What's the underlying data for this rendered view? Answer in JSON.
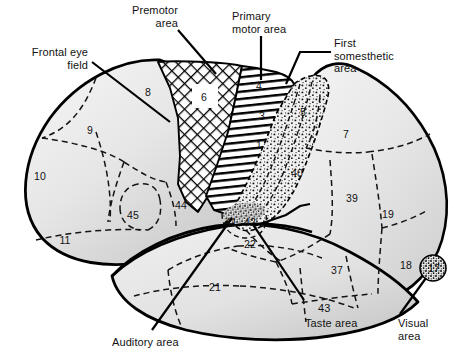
{
  "figure": {
    "view": "lateral"
  },
  "palette": {
    "outline": "#000000",
    "cortex_fill_light": "#ededed",
    "cortex_fill_mid": "#e0e0e0",
    "cortex_fill_dark": "#c9c9c9",
    "dashed_border": "#1a1a1a",
    "text": "#121212",
    "leader_line": "#000000",
    "hatch_crosshatch": "#000000",
    "hatch_horizontal": "#000000",
    "stipple": "#000000"
  },
  "callouts": [
    {
      "id": "premotor",
      "text": "Premotor\narea",
      "x": 108,
      "y": 4,
      "align": "right",
      "width": 70
    },
    {
      "id": "primary-motor",
      "text": "Primary\nmotor area",
      "x": 232,
      "y": 10,
      "align": "left",
      "width": 80
    },
    {
      "id": "first-somesthetic",
      "text": "First\nsomesthetic\narea",
      "x": 334,
      "y": 37,
      "align": "left",
      "width": 80
    },
    {
      "id": "frontal-eye-field",
      "text": "Frontal eye\nfield",
      "x": 8,
      "y": 46,
      "align": "right",
      "width": 80
    },
    {
      "id": "auditory",
      "text": "Auditory area",
      "x": 112,
      "y": 336,
      "align": "left",
      "width": 90
    },
    {
      "id": "taste-number",
      "text": "43",
      "x": 318,
      "y": 302,
      "align": "left",
      "width": 24
    },
    {
      "id": "taste",
      "text": "Taste area",
      "x": 305,
      "y": 317,
      "align": "left",
      "width": 70
    },
    {
      "id": "visual",
      "text": "Visual\narea",
      "x": 398,
      "y": 317,
      "align": "left",
      "width": 48
    }
  ],
  "brodmann_areas": [
    {
      "number": "8",
      "x": 148,
      "y": 92,
      "region": "frontal"
    },
    {
      "number": "6",
      "x": 203,
      "y": 96,
      "region": "premotor",
      "boxed": true
    },
    {
      "number": "4",
      "x": 259,
      "y": 86,
      "region": "primary-motor"
    },
    {
      "number": "9",
      "x": 90,
      "y": 130,
      "region": "frontal"
    },
    {
      "number": "3",
      "x": 262,
      "y": 116,
      "region": "somesthetic"
    },
    {
      "number": "1",
      "x": 259,
      "y": 145,
      "region": "somesthetic"
    },
    {
      "number": "5",
      "x": 303,
      "y": 112,
      "region": "parietal"
    },
    {
      "number": "7",
      "x": 346,
      "y": 134,
      "region": "parietal"
    },
    {
      "number": "10",
      "x": 40,
      "y": 176,
      "region": "frontal-pole"
    },
    {
      "number": "40",
      "x": 297,
      "y": 173,
      "region": "parietal"
    },
    {
      "number": "39",
      "x": 352,
      "y": 198,
      "region": "parietal"
    },
    {
      "number": "19",
      "x": 388,
      "y": 214,
      "region": "occipital"
    },
    {
      "number": "45",
      "x": 133,
      "y": 215,
      "region": "frontal"
    },
    {
      "number": "44",
      "x": 181,
      "y": 205,
      "region": "frontal"
    },
    {
      "number": "41",
      "x": 231,
      "y": 222,
      "region": "auditory"
    },
    {
      "number": "42",
      "x": 250,
      "y": 222,
      "region": "auditory"
    },
    {
      "number": "11",
      "x": 65,
      "y": 240,
      "region": "orbital"
    },
    {
      "number": "22",
      "x": 250,
      "y": 244,
      "region": "temporal"
    },
    {
      "number": "37",
      "x": 337,
      "y": 270,
      "region": "temporal"
    },
    {
      "number": "18",
      "x": 406,
      "y": 265,
      "region": "occipital"
    },
    {
      "number": "17",
      "x": 434,
      "y": 268,
      "region": "visual"
    },
    {
      "number": "21",
      "x": 215,
      "y": 287,
      "region": "temporal"
    }
  ]
}
